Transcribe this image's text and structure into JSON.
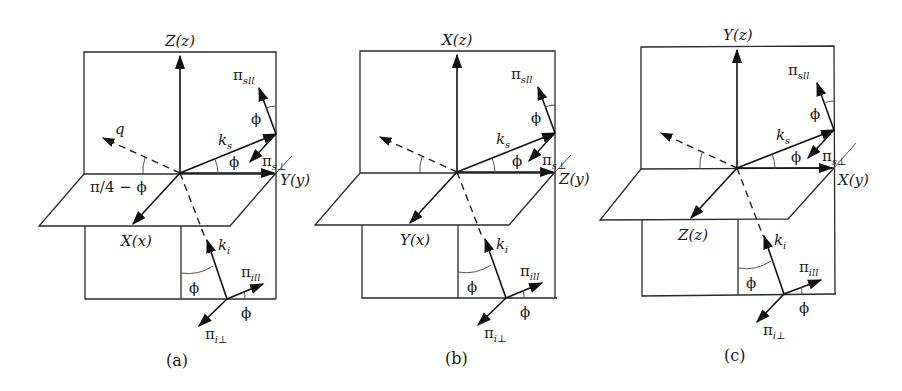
{
  "figure": {
    "panels": [
      {
        "id": "a",
        "caption": "(a)",
        "vertical_axis": "Z(z)",
        "horizontal_axis": "Y(y)",
        "oblique_axis": "X(x)",
        "q_label": "q",
        "angle_label_q": "π/4 − ϕ",
        "ks": "k",
        "ks_sub": "s",
        "ki": "k",
        "ki_sub": "i",
        "pi_s_par": "π",
        "pi_s_par_sub": "sll",
        "pi_s_perp": "π",
        "pi_s_perp_sub": "s⊥",
        "pi_i_par": "π",
        "pi_i_par_sub": "ill",
        "pi_i_perp": "π",
        "pi_i_perp_sub": "i⊥",
        "phi": "ϕ"
      },
      {
        "id": "b",
        "caption": "(b)",
        "vertical_axis": "X(z)",
        "horizontal_axis": "Z(y)",
        "oblique_axis": "Y(x)",
        "ks": "k",
        "ks_sub": "s",
        "ki": "k",
        "ki_sub": "i",
        "pi_s_par": "π",
        "pi_s_par_sub": "sll",
        "pi_s_perp": "π",
        "pi_s_perp_sub": "s⊥",
        "pi_i_par": "π",
        "pi_i_par_sub": "ill",
        "pi_i_perp": "π",
        "pi_i_perp_sub": "i⊥",
        "phi": "ϕ"
      },
      {
        "id": "c",
        "caption": "(c)",
        "vertical_axis": "Y(z)",
        "horizontal_axis": "X(y)",
        "oblique_axis": "Z(z)",
        "ks": "k",
        "ks_sub": "s",
        "ki": "k",
        "ki_sub": "i",
        "pi_s_par": "π",
        "pi_s_par_sub": "sll",
        "pi_s_perp": "π",
        "pi_s_perp_sub": "s⊥",
        "pi_i_par": "π",
        "pi_i_par_sub": "ill",
        "pi_i_perp": "π",
        "pi_i_perp_sub": "i⊥",
        "phi": "ϕ"
      }
    ]
  }
}
